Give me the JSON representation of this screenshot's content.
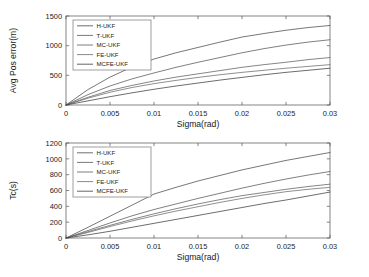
{
  "figure": {
    "background": "#ffffff",
    "panel_count": 2
  },
  "chart_data": [
    {
      "type": "line",
      "title": "",
      "panel": "top",
      "xlabel": "Sigma(rad)",
      "ylabel": "Avg Pos error(m)",
      "xlim": [
        0,
        0.03
      ],
      "ylim": [
        0,
        1500
      ],
      "xticks": [
        0,
        0.005,
        0.01,
        0.015,
        0.02,
        0.025,
        0.03
      ],
      "xticklabels": [
        "0",
        "0.005",
        "0.01",
        "0.015",
        "0.02",
        "0.025",
        "0.03"
      ],
      "yticks": [
        0,
        500,
        1000,
        1500
      ],
      "yticklabels": [
        "0",
        "500",
        "1000",
        "1500"
      ],
      "grid": false,
      "legend_position": "upper left",
      "x": [
        0,
        0.0025,
        0.005,
        0.0075,
        0.01,
        0.0125,
        0.015,
        0.0175,
        0.02,
        0.0225,
        0.025,
        0.0275,
        0.03
      ],
      "series": [
        {
          "name": "H-UKF",
          "color": "#4a4a4a",
          "values": [
            0,
            260,
            470,
            640,
            775,
            880,
            970,
            1060,
            1145,
            1205,
            1260,
            1305,
            1340
          ]
        },
        {
          "name": "T-UKF",
          "color": "#565656",
          "values": [
            0,
            175,
            320,
            440,
            540,
            635,
            720,
            800,
            880,
            950,
            1010,
            1060,
            1100
          ]
        },
        {
          "name": "MC-UKF",
          "color": "#5e5e5e",
          "values": [
            0,
            130,
            245,
            330,
            405,
            470,
            525,
            580,
            635,
            680,
            720,
            765,
            800
          ]
        },
        {
          "name": "FE-UKF",
          "color": "#6a6a6a",
          "values": [
            0,
            115,
            215,
            295,
            360,
            415,
            465,
            510,
            550,
            585,
            620,
            650,
            680
          ]
        },
        {
          "name": "MCFE-UKF",
          "color": "#3c3c3c",
          "values": [
            0,
            70,
            140,
            205,
            265,
            320,
            370,
            420,
            465,
            510,
            550,
            585,
            620
          ]
        }
      ]
    },
    {
      "type": "line",
      "title": "",
      "panel": "bottom",
      "xlabel": "Sigma(rad)",
      "ylabel": "Tc(s)",
      "xlim": [
        0,
        0.03
      ],
      "ylim": [
        0,
        1200
      ],
      "xticks": [
        0,
        0.005,
        0.01,
        0.015,
        0.02,
        0.025,
        0.03
      ],
      "xticklabels": [
        "0",
        "0.005",
        "0.01",
        "0.015",
        "0.02",
        "0.025",
        "0.03"
      ],
      "yticks": [
        0,
        200,
        400,
        600,
        800,
        1000,
        1200
      ],
      "yticklabels": [
        "0",
        "200",
        "400",
        "600",
        "800",
        "1000",
        "1200"
      ],
      "grid": false,
      "legend_position": "upper left",
      "x": [
        0,
        0.0025,
        0.005,
        0.0075,
        0.01,
        0.0125,
        0.015,
        0.0175,
        0.02,
        0.0225,
        0.025,
        0.0275,
        0.03
      ],
      "series": [
        {
          "name": "H-UKF",
          "color": "#4a4a4a",
          "values": [
            0,
            135,
            275,
            415,
            555,
            640,
            720,
            790,
            860,
            920,
            980,
            1030,
            1080
          ]
        },
        {
          "name": "T-UKF",
          "color": "#565656",
          "values": [
            0,
            95,
            190,
            280,
            360,
            430,
            500,
            565,
            630,
            690,
            745,
            795,
            840
          ]
        },
        {
          "name": "MC-UKF",
          "color": "#5e5e5e",
          "values": [
            0,
            80,
            160,
            235,
            305,
            370,
            430,
            485,
            535,
            575,
            615,
            650,
            680
          ]
        },
        {
          "name": "FE-UKF",
          "color": "#6a6a6a",
          "values": [
            0,
            70,
            145,
            215,
            280,
            340,
            395,
            450,
            500,
            545,
            585,
            615,
            640
          ]
        },
        {
          "name": "MCFE-UKF",
          "color": "#3c3c3c",
          "values": [
            0,
            40,
            85,
            135,
            185,
            235,
            285,
            335,
            385,
            435,
            480,
            530,
            580
          ]
        }
      ]
    }
  ],
  "legend": {
    "entries": [
      "H-UKF",
      "T-UKF",
      "MC-UKF",
      "FE-UKF",
      "MCFE-UKF"
    ]
  }
}
